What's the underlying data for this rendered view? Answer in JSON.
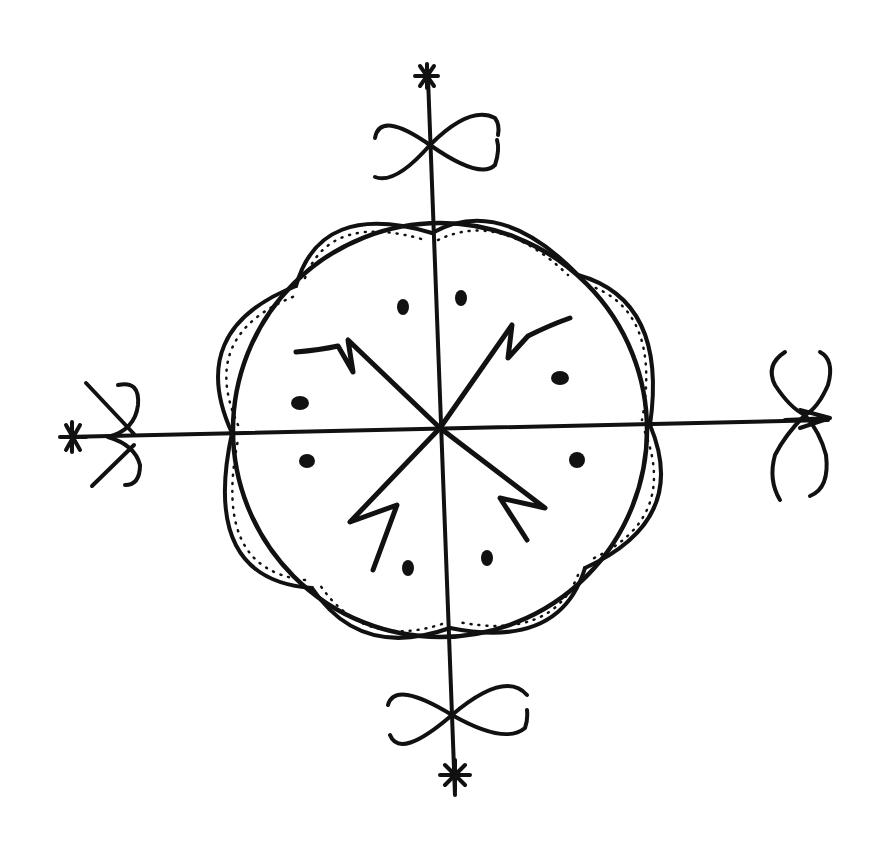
{
  "image": {
    "description": "Hand-drawn black ink symbol on white: circle quartered by a cross, eight scalloped dotted-edge petals around it, four zigzag rays, eight dots, and infinity-loop/asterisk terminals on each axis arm",
    "colors": {
      "ink": "#111111",
      "paper": "#ffffff"
    },
    "elements": {
      "circle": {
        "cx": 440,
        "cy": 428,
        "r": 205
      },
      "petals_count": 8,
      "dots_count": 8,
      "zigzag_rays_count": 4,
      "arm_terminals": [
        "top: infinity-loop + asterisk",
        "bottom: infinity-loop + asterisk",
        "left: crossed hooks + asterisk",
        "right: vertical loops + arrowhead"
      ]
    }
  }
}
